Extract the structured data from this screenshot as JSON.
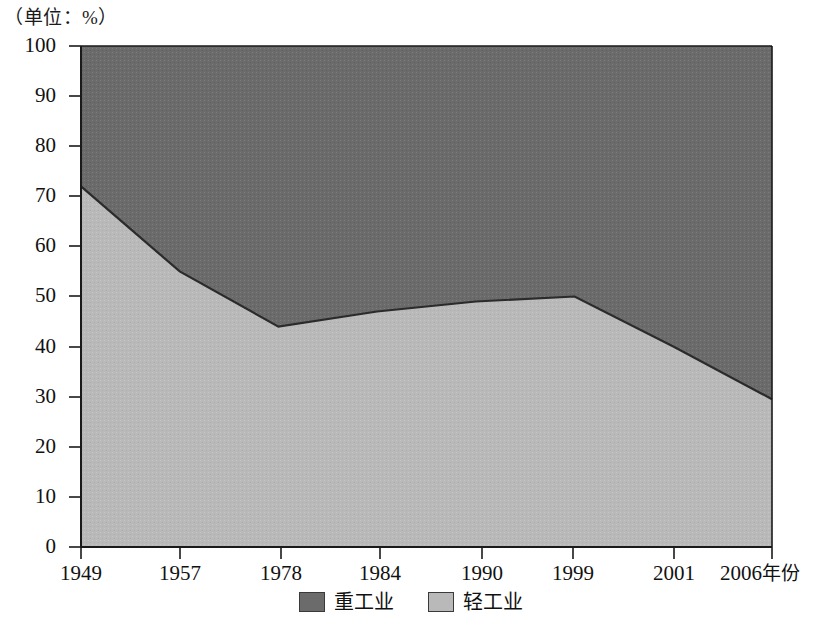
{
  "unit_label": "（单位：%）",
  "axis": {
    "x_unit_label": "年份",
    "y_ticks": [
      "100",
      "90",
      "80",
      "70",
      "60",
      "50",
      "40",
      "30",
      "20",
      "10",
      "0"
    ],
    "x_ticks": [
      "1949",
      "1957",
      "1978",
      "1984",
      "1990",
      "1999",
      "2001",
      "2006"
    ]
  },
  "legend": {
    "items": [
      {
        "label": "重工业",
        "color": "#6b6b6b"
      },
      {
        "label": "轻工业",
        "color": "#b9b9b9"
      }
    ]
  },
  "colors": {
    "heavy_industry": "#6b6b6b",
    "light_industry": "#b9b9b9",
    "axis": "#1a1a1a",
    "boundary": "#2b2b2b",
    "background": "#ffffff"
  },
  "chart_data": {
    "type": "area",
    "title": "",
    "subtitle": "",
    "xlabel": "年份",
    "ylabel": "（单位：%）",
    "stacked": true,
    "grid": false,
    "legend_position": "bottom",
    "ylim": [
      0,
      100
    ],
    "ytick_step": 10,
    "categories": [
      "1949",
      "1957",
      "1978",
      "1984",
      "1990",
      "1999",
      "2001",
      "2006"
    ],
    "series": [
      {
        "name": "轻工业",
        "color": "#b9b9b9",
        "values": [
          72,
          55,
          44,
          47,
          49,
          50,
          40,
          29.5
        ]
      },
      {
        "name": "重工业",
        "color": "#6b6b6b",
        "values": [
          28,
          45,
          56,
          53,
          51,
          50,
          60,
          70.5
        ]
      }
    ],
    "annotations": []
  }
}
